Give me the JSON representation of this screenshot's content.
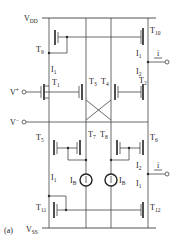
{
  "figure_label": "(a)",
  "rails": {
    "vdd": "V",
    "vdd_sub": "DD",
    "vss": "V",
    "vss_sub": "SS"
  },
  "inputs": {
    "vplus": "V",
    "vplus_sup": "+",
    "vplus_sub": "i",
    "vminus": "V",
    "vminus_sup": "−",
    "vminus_sub": "i"
  },
  "output": {
    "label": "i"
  },
  "transistors": [
    {
      "id": "T1",
      "label": "T",
      "sub": "1"
    },
    {
      "id": "T2",
      "label": "T",
      "sub": "2"
    },
    {
      "id": "T3",
      "label": "T",
      "sub": "3"
    },
    {
      "id": "T4",
      "label": "T",
      "sub": "4"
    },
    {
      "id": "T5",
      "label": "T",
      "sub": "5"
    },
    {
      "id": "T6",
      "label": "T",
      "sub": "6"
    },
    {
      "id": "T7",
      "label": "T",
      "sub": "7"
    },
    {
      "id": "T8",
      "label": "T",
      "sub": "8"
    },
    {
      "id": "T9",
      "label": "T",
      "sub": "9"
    },
    {
      "id": "T10",
      "label": "T",
      "sub": "10"
    },
    {
      "id": "T11",
      "label": "T",
      "sub": "11"
    },
    {
      "id": "T12",
      "label": "T",
      "sub": "12"
    }
  ],
  "currents": {
    "i1": "I",
    "i1_sub": "1",
    "i2": "I",
    "i2_sub": "2",
    "ib": "I",
    "ib_sub": "B"
  }
}
